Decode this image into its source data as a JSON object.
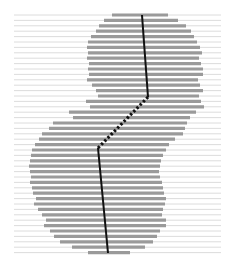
{
  "figure": {
    "width": 231,
    "height": 266,
    "background": "#ffffff",
    "gridline_color": "#d8d8d8",
    "bar_color": "#9a9a9a",
    "line_color": "#111111",
    "bar_thickness": 3.2,
    "gridline_thickness": 0.9,
    "line_thickness": 2.0
  },
  "chart_data": {
    "type": "bar",
    "title": "",
    "subtitle": "",
    "xlabel": "",
    "ylabel": "",
    "legend": [],
    "grid": true,
    "grid_orientation": "horizontal-full-width",
    "orientation": "horizontal",
    "xlim": [
      0,
      231
    ],
    "ylim": [
      0,
      266
    ],
    "axis_visible": false,
    "tick_labels_x": [],
    "tick_labels_y": [],
    "row_pitch": 5.4,
    "row_start_y": 15,
    "rows": [
      {
        "index": 0,
        "y": 15,
        "bar_start": 112,
        "bar_end": 168
      },
      {
        "index": 1,
        "y": 20.4,
        "bar_start": 104,
        "bar_end": 178
      },
      {
        "index": 2,
        "y": 25.8,
        "bar_start": 99,
        "bar_end": 186
      },
      {
        "index": 3,
        "y": 31.2,
        "bar_start": 96,
        "bar_end": 191
      },
      {
        "index": 4,
        "y": 36.6,
        "bar_start": 91,
        "bar_end": 194
      },
      {
        "index": 5,
        "y": 42.0,
        "bar_start": 88,
        "bar_end": 197
      },
      {
        "index": 6,
        "y": 47.4,
        "bar_start": 87,
        "bar_end": 200
      },
      {
        "index": 7,
        "y": 52.8,
        "bar_start": 88,
        "bar_end": 202
      },
      {
        "index": 8,
        "y": 58.2,
        "bar_start": 87,
        "bar_end": 199
      },
      {
        "index": 9,
        "y": 63.6,
        "bar_start": 89,
        "bar_end": 201
      },
      {
        "index": 10,
        "y": 69.0,
        "bar_start": 88,
        "bar_end": 203
      },
      {
        "index": 11,
        "y": 74.4,
        "bar_start": 89,
        "bar_end": 203
      },
      {
        "index": 12,
        "y": 79.8,
        "bar_start": 87,
        "bar_end": 198
      },
      {
        "index": 13,
        "y": 85.2,
        "bar_start": 92,
        "bar_end": 200
      },
      {
        "index": 14,
        "y": 90.6,
        "bar_start": 96,
        "bar_end": 203
      },
      {
        "index": 15,
        "y": 96.0,
        "bar_start": 98,
        "bar_end": 199
      },
      {
        "index": 16,
        "y": 101.4,
        "bar_start": 86,
        "bar_end": 201
      },
      {
        "index": 17,
        "y": 106.8,
        "bar_start": 90,
        "bar_end": 204
      },
      {
        "index": 18,
        "y": 112.2,
        "bar_start": 69,
        "bar_end": 196
      },
      {
        "index": 19,
        "y": 117.6,
        "bar_start": 73,
        "bar_end": 190
      },
      {
        "index": 20,
        "y": 123.0,
        "bar_start": 53,
        "bar_end": 187
      },
      {
        "index": 21,
        "y": 128.4,
        "bar_start": 49,
        "bar_end": 185
      },
      {
        "index": 22,
        "y": 133.8,
        "bar_start": 42,
        "bar_end": 183
      },
      {
        "index": 23,
        "y": 139.2,
        "bar_start": 39,
        "bar_end": 175
      },
      {
        "index": 24,
        "y": 144.6,
        "bar_start": 35,
        "bar_end": 169
      },
      {
        "index": 25,
        "y": 150.0,
        "bar_start": 32,
        "bar_end": 166
      },
      {
        "index": 26,
        "y": 155.4,
        "bar_start": 31,
        "bar_end": 163
      },
      {
        "index": 27,
        "y": 160.8,
        "bar_start": 30,
        "bar_end": 161
      },
      {
        "index": 28,
        "y": 166.2,
        "bar_start": 29,
        "bar_end": 160
      },
      {
        "index": 29,
        "y": 171.6,
        "bar_start": 30,
        "bar_end": 159
      },
      {
        "index": 30,
        "y": 177.0,
        "bar_start": 31,
        "bar_end": 160
      },
      {
        "index": 31,
        "y": 182.4,
        "bar_start": 30,
        "bar_end": 162
      },
      {
        "index": 32,
        "y": 187.8,
        "bar_start": 32,
        "bar_end": 163
      },
      {
        "index": 33,
        "y": 193.2,
        "bar_start": 33,
        "bar_end": 164
      },
      {
        "index": 34,
        "y": 198.6,
        "bar_start": 36,
        "bar_end": 166
      },
      {
        "index": 35,
        "y": 204.0,
        "bar_start": 34,
        "bar_end": 165
      },
      {
        "index": 36,
        "y": 209.4,
        "bar_start": 38,
        "bar_end": 163
      },
      {
        "index": 37,
        "y": 214.8,
        "bar_start": 42,
        "bar_end": 162
      },
      {
        "index": 38,
        "y": 220.2,
        "bar_start": 46,
        "bar_end": 166
      },
      {
        "index": 39,
        "y": 225.6,
        "bar_start": 44,
        "bar_end": 166
      },
      {
        "index": 40,
        "y": 231.0,
        "bar_start": 50,
        "bar_end": 160
      },
      {
        "index": 41,
        "y": 236.4,
        "bar_start": 54,
        "bar_end": 157
      },
      {
        "index": 42,
        "y": 241.8,
        "bar_start": 60,
        "bar_end": 153
      },
      {
        "index": 43,
        "y": 247.2,
        "bar_start": 72,
        "bar_end": 145
      },
      {
        "index": 44,
        "y": 252.6,
        "bar_start": 88,
        "bar_end": 130
      }
    ],
    "estimate_line": {
      "label": "",
      "points": [
        {
          "x": 142,
          "y": 15
        },
        {
          "x": 148,
          "y": 97
        },
        {
          "x": 98,
          "y": 148
        },
        {
          "x": 108,
          "y": 253
        }
      ],
      "segment_styles": [
        "solid",
        "dotted-dashed",
        "solid"
      ]
    }
  }
}
